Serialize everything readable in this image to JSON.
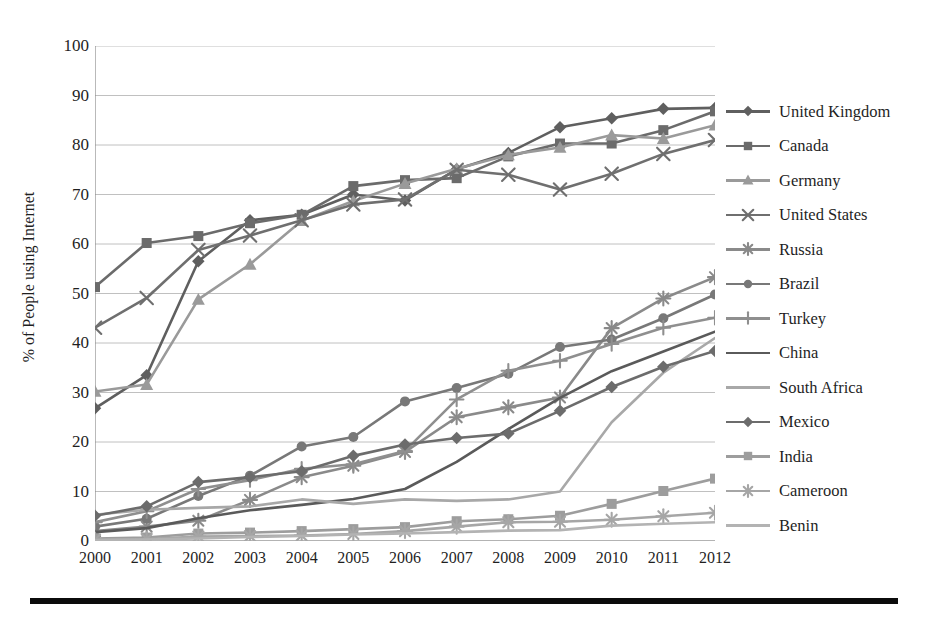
{
  "chart_data": {
    "type": "line",
    "title": "",
    "xlabel": "",
    "ylabel": "% of People using Internet",
    "categories": [
      "2000",
      "2001",
      "2002",
      "2003",
      "2004",
      "2005",
      "2006",
      "2007",
      "2008",
      "2009",
      "2010",
      "2011",
      "2012"
    ],
    "x": [
      2000,
      2001,
      2002,
      2003,
      2004,
      2005,
      2006,
      2007,
      2008,
      2009,
      2010,
      2011,
      2012
    ],
    "xlim": [
      2000,
      2012
    ],
    "ylim": [
      0,
      100
    ],
    "yticks": [
      0,
      10,
      20,
      30,
      40,
      50,
      60,
      70,
      80,
      90,
      100
    ],
    "grid": "horizontal",
    "legend_position": "right",
    "series": [
      {
        "name": "United Kingdom",
        "color": "#5f5f5f",
        "marker": "diamond",
        "values": [
          26.8,
          33.5,
          56.5,
          64.8,
          65.9,
          70.0,
          68.8,
          75.1,
          78.4,
          83.6,
          85.4,
          87.3,
          87.5
        ]
      },
      {
        "name": "Canada",
        "color": "#6b6b6b",
        "marker": "square",
        "values": [
          51.3,
          60.2,
          61.6,
          64.2,
          65.9,
          71.7,
          72.9,
          73.3,
          77.7,
          80.3,
          80.3,
          83.0,
          86.8
        ]
      },
      {
        "name": "Germany",
        "color": "#9a9a9a",
        "marker": "triangle",
        "values": [
          30.2,
          31.6,
          48.8,
          55.9,
          64.7,
          68.7,
          72.2,
          75.2,
          78.0,
          79.5,
          82.0,
          81.3,
          84.0
        ]
      },
      {
        "name": "United States",
        "color": "#6f6f6f",
        "marker": "x",
        "values": [
          43.1,
          49.1,
          58.8,
          61.7,
          64.8,
          68.0,
          69.0,
          75.0,
          74.0,
          71.0,
          74.2,
          78.2,
          81.0
        ]
      },
      {
        "name": "Russia",
        "color": "#8a8a8a",
        "marker": "star",
        "values": [
          2.0,
          2.9,
          4.1,
          8.3,
          12.9,
          15.2,
          18.0,
          25.0,
          27.0,
          29.0,
          43.0,
          49.0,
          53.3
        ]
      },
      {
        "name": "Brazil",
        "color": "#787878",
        "marker": "circle",
        "values": [
          2.9,
          4.5,
          9.1,
          13.2,
          19.1,
          21.0,
          28.2,
          30.9,
          33.8,
          39.2,
          40.7,
          45.0,
          49.8
        ]
      },
      {
        "name": "Turkey",
        "color": "#8f8f8f",
        "marker": "plus",
        "values": [
          3.8,
          6.0,
          10.5,
          12.3,
          14.6,
          15.5,
          18.2,
          28.6,
          34.4,
          36.4,
          39.8,
          43.1,
          45.1
        ]
      },
      {
        "name": "China",
        "color": "#5a5a5a",
        "marker": "none",
        "values": [
          1.8,
          2.6,
          4.6,
          6.2,
          7.3,
          8.5,
          10.5,
          16.0,
          22.6,
          28.9,
          34.3,
          38.3,
          42.3
        ]
      },
      {
        "name": "South Africa",
        "color": "#a8a8a8",
        "marker": "none",
        "values": [
          5.3,
          6.3,
          6.7,
          7.0,
          8.4,
          7.5,
          8.4,
          8.1,
          8.4,
          10.0,
          24.0,
          34.0,
          41.0
        ]
      },
      {
        "name": "Mexico",
        "color": "#6c6c6c",
        "marker": "diamond",
        "values": [
          5.1,
          7.0,
          11.9,
          12.9,
          14.1,
          17.2,
          19.5,
          20.8,
          21.7,
          26.3,
          31.1,
          35.2,
          38.4
        ]
      },
      {
        "name": "India",
        "color": "#9d9d9d",
        "marker": "square",
        "values": [
          0.5,
          0.7,
          1.5,
          1.7,
          2.0,
          2.4,
          2.8,
          4.0,
          4.4,
          5.1,
          7.5,
          10.1,
          12.6
        ]
      },
      {
        "name": "Cameroon",
        "color": "#a6a6a6",
        "marker": "star",
        "values": [
          0.3,
          0.4,
          0.9,
          1.0,
          1.1,
          1.4,
          2.0,
          2.9,
          3.8,
          3.9,
          4.3,
          5.0,
          5.7
        ]
      },
      {
        "name": "Benin",
        "color": "#b3b3b3",
        "marker": "none",
        "values": [
          0.2,
          0.3,
          0.5,
          0.8,
          1.0,
          1.3,
          1.5,
          1.8,
          2.1,
          2.2,
          3.1,
          3.5,
          3.8
        ]
      }
    ]
  },
  "axis": {
    "y_title": "% of People using Internet",
    "y_ticks": [
      "100",
      "90",
      "80",
      "70",
      "60",
      "50",
      "40",
      "30",
      "20",
      "10",
      "0"
    ],
    "x_ticks": [
      "2000",
      "2001",
      "2002",
      "2003",
      "2004",
      "2005",
      "2006",
      "2007",
      "2008",
      "2009",
      "2010",
      "2011",
      "2012"
    ]
  },
  "legend": {
    "items": [
      {
        "label": "United Kingdom"
      },
      {
        "label": "Canada"
      },
      {
        "label": "Germany"
      },
      {
        "label": "United States"
      },
      {
        "label": "Russia"
      },
      {
        "label": "Brazil"
      },
      {
        "label": "Turkey"
      },
      {
        "label": "China"
      },
      {
        "label": "South Africa"
      },
      {
        "label": "Mexico"
      },
      {
        "label": "India"
      },
      {
        "label": "Cameroon"
      },
      {
        "label": "Benin"
      }
    ]
  },
  "colors": {
    "grid": "#b9b9b9",
    "axis": "#8a8a8a",
    "text": "#1f1f1f",
    "rule": "#0b0b0b",
    "background": "#ffffff"
  }
}
